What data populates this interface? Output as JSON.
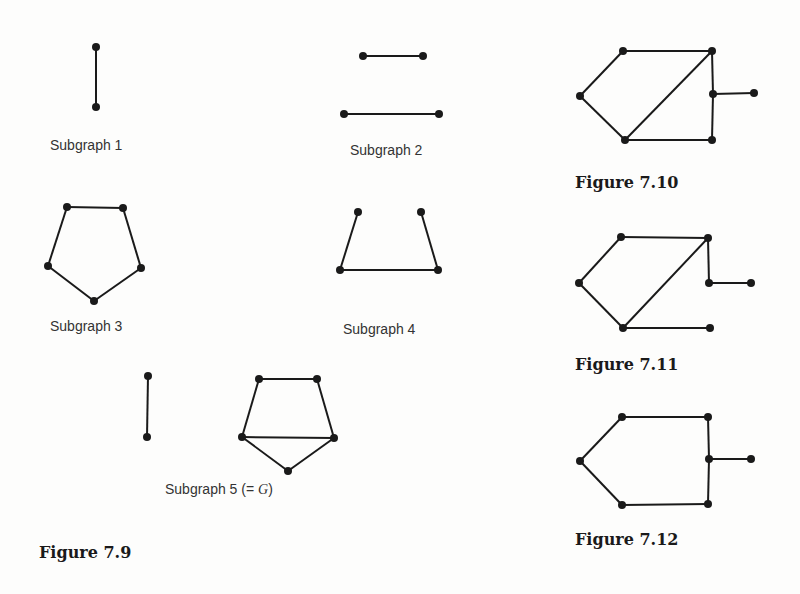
{
  "captions": {
    "sub1": "Subgraph 1",
    "sub2": "Subgraph 2",
    "sub3": "Subgraph 3",
    "sub4": "Subgraph 4",
    "sub5_prefix": "Subgraph 5 (= ",
    "sub5_var": "G",
    "sub5_suffix": ")",
    "fig79": "Figure 7.9",
    "fig710": "Figure 7.10",
    "fig711": "Figure 7.11",
    "fig712": "Figure 7.12"
  },
  "style": {
    "stroke": "#1a1a1a",
    "node_radius": 4
  },
  "graphs": [
    {
      "id": "subgraph-1",
      "nodes": [
        [
          96,
          47
        ],
        [
          96,
          107
        ]
      ],
      "edges": [
        [
          0,
          1
        ]
      ]
    },
    {
      "id": "subgraph-2",
      "nodes": [
        [
          363,
          56
        ],
        [
          423,
          56
        ],
        [
          344,
          114
        ],
        [
          439,
          114
        ]
      ],
      "edges": [
        [
          0,
          1
        ],
        [
          2,
          3
        ]
      ]
    },
    {
      "id": "subgraph-3",
      "nodes": [
        [
          67,
          207
        ],
        [
          123,
          208
        ],
        [
          48,
          266
        ],
        [
          141,
          268
        ],
        [
          94,
          301
        ]
      ],
      "edges": [
        [
          0,
          1
        ],
        [
          1,
          3
        ],
        [
          3,
          4
        ],
        [
          4,
          2
        ],
        [
          2,
          0
        ]
      ]
    },
    {
      "id": "subgraph-4",
      "nodes": [
        [
          358,
          212
        ],
        [
          421,
          212
        ],
        [
          340,
          270
        ],
        [
          438,
          270
        ]
      ],
      "edges": [
        [
          0,
          2
        ],
        [
          2,
          3
        ],
        [
          3,
          1
        ]
      ]
    },
    {
      "id": "subgraph-5",
      "nodes": [
        [
          148,
          376
        ],
        [
          147,
          437
        ],
        [
          259,
          379
        ],
        [
          317,
          379
        ],
        [
          242,
          437
        ],
        [
          334,
          438
        ],
        [
          288,
          471
        ]
      ],
      "edges": [
        [
          0,
          1
        ],
        [
          2,
          3
        ],
        [
          3,
          5
        ],
        [
          5,
          4
        ],
        [
          4,
          2
        ],
        [
          4,
          6
        ],
        [
          6,
          5
        ]
      ]
    },
    {
      "id": "figure-7-10",
      "nodes": [
        [
          623,
          51
        ],
        [
          712,
          51
        ],
        [
          580,
          96
        ],
        [
          713,
          94
        ],
        [
          754,
          93
        ],
        [
          625,
          140
        ],
        [
          712,
          140
        ]
      ],
      "edges": [
        [
          0,
          1
        ],
        [
          0,
          2
        ],
        [
          2,
          5
        ],
        [
          5,
          1
        ],
        [
          1,
          3
        ],
        [
          3,
          6
        ],
        [
          5,
          6
        ],
        [
          3,
          4
        ]
      ]
    },
    {
      "id": "figure-7-11",
      "nodes": [
        [
          621,
          237
        ],
        [
          708,
          238
        ],
        [
          579,
          283
        ],
        [
          709,
          283
        ],
        [
          751,
          283
        ],
        [
          623,
          328
        ],
        [
          710,
          328
        ]
      ],
      "edges": [
        [
          0,
          1
        ],
        [
          0,
          2
        ],
        [
          2,
          5
        ],
        [
          5,
          1
        ],
        [
          1,
          3
        ],
        [
          3,
          4
        ],
        [
          5,
          6
        ]
      ]
    },
    {
      "id": "figure-7-12",
      "nodes": [
        [
          622,
          417
        ],
        [
          708,
          417
        ],
        [
          580,
          461
        ],
        [
          709,
          459
        ],
        [
          751,
          459
        ],
        [
          622,
          505
        ],
        [
          708,
          504
        ]
      ],
      "edges": [
        [
          0,
          1
        ],
        [
          0,
          2
        ],
        [
          2,
          5
        ],
        [
          5,
          6
        ],
        [
          1,
          3
        ],
        [
          3,
          6
        ],
        [
          3,
          4
        ]
      ]
    }
  ]
}
